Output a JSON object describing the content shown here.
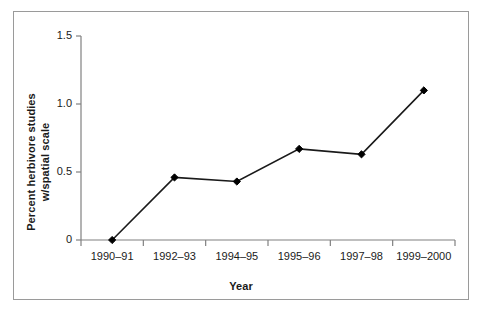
{
  "figure": {
    "frame_color": "#9a9a9a",
    "background": "#ffffff",
    "line_color": "#1a1a1a",
    "marker_color": "#000000"
  },
  "chart_data": {
    "type": "line",
    "title": "",
    "xlabel": "Year",
    "ylabel": "Percent herbivore studies w/spatial scale",
    "ylabel_lines": [
      "Percent herbivore studies",
      "w/spatial scale"
    ],
    "categories": [
      "1990–91",
      "1992–93",
      "1994–95",
      "1995–96",
      "1997–98",
      "1999–2000"
    ],
    "values": [
      0,
      0.46,
      0.43,
      0.67,
      0.63,
      1.1
    ],
    "ylim": [
      0,
      1.5
    ],
    "yticks": [
      0,
      0.5,
      1.0,
      1.5
    ],
    "ytick_labels": [
      "0",
      "0.5",
      "1.0",
      "1.5"
    ],
    "grid": false,
    "legend": false,
    "marker": "diamond",
    "series": [
      {
        "name": "Percent herbivore studies w/spatial scale",
        "values": [
          0,
          0.46,
          0.43,
          0.67,
          0.63,
          1.1
        ]
      }
    ]
  }
}
